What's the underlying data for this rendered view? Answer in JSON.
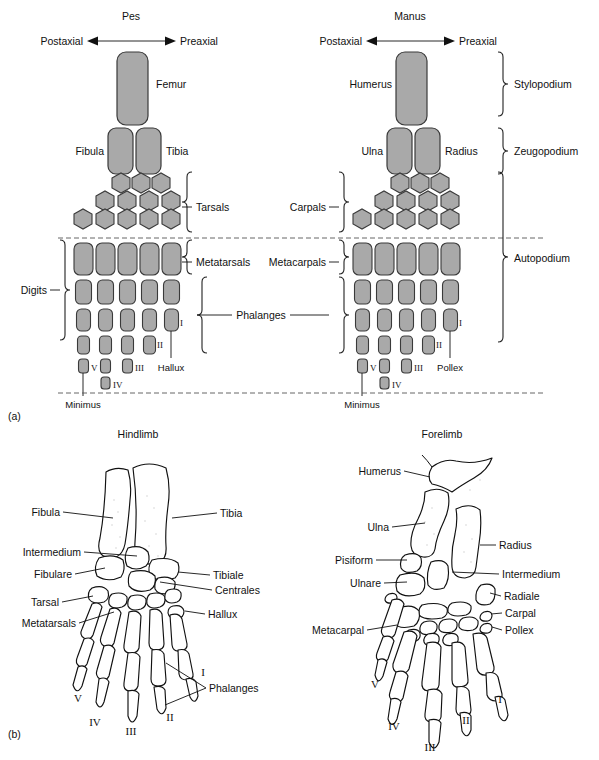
{
  "figure": {
    "panel_a_label": "(a)",
    "panel_b_label": "(b)"
  },
  "panel_a": {
    "left": {
      "title": "Pes",
      "axis_left": "Postaxial",
      "axis_right": "Preaxial",
      "bones": {
        "stylopod": "Femur",
        "zeugopod_post": "Fibula",
        "zeugopod_pre": "Tibia"
      },
      "group_labels": {
        "carpal_tarsal": "Tarsals",
        "metapodial": "Metatarsals",
        "digits": "Digits"
      },
      "digit_numbers": [
        "I",
        "II",
        "III",
        "IV",
        "V"
      ],
      "preaxial_digit": "Hallux",
      "postaxial_digit": "Minimus"
    },
    "right": {
      "title": "Manus",
      "axis_left": "Postaxial",
      "axis_right": "Preaxial",
      "bones": {
        "stylopod": "Humerus",
        "zeugopod_post": "Ulna",
        "zeugopod_pre": "Radius"
      },
      "group_labels": {
        "carpal_tarsal": "Carpals",
        "metapodial": "Metacarpals"
      },
      "digit_numbers": [
        "I",
        "II",
        "III",
        "IV",
        "V"
      ],
      "preaxial_digit": "Pollex",
      "postaxial_digit": "Minimus"
    },
    "shared": {
      "phalanges": "Phalanges"
    },
    "segments": [
      "Stylopodium",
      "Zeugopodium",
      "Autopodium"
    ]
  },
  "panel_b": {
    "hindlimb": {
      "title": "Hindlimb",
      "labels_left": [
        "Fibula",
        "Intermedium",
        "Fibulare",
        "Tarsal",
        "Metatarsals"
      ],
      "labels_right": [
        "Tibia",
        "Tibiale",
        "Centrales",
        "Hallux"
      ],
      "digit_numbers": [
        "I",
        "II",
        "III",
        "IV",
        "V"
      ],
      "phalanges_label": "Phalanges"
    },
    "forelimb": {
      "title": "Forelimb",
      "labels_left": [
        "Humerus",
        "Ulna",
        "Pisiform",
        "Ulnare",
        "Metacarpal"
      ],
      "labels_right": [
        "Radius",
        "Intermedium",
        "Radiale",
        "Carpal",
        "Pollex"
      ],
      "digit_numbers": [
        "I",
        "II",
        "III",
        "IV",
        "V"
      ]
    }
  },
  "colors": {
    "bone_fill": "#a9a9a9",
    "bone_stroke": "#3a3a3a",
    "text": "#111111",
    "dashed": "#555555"
  }
}
